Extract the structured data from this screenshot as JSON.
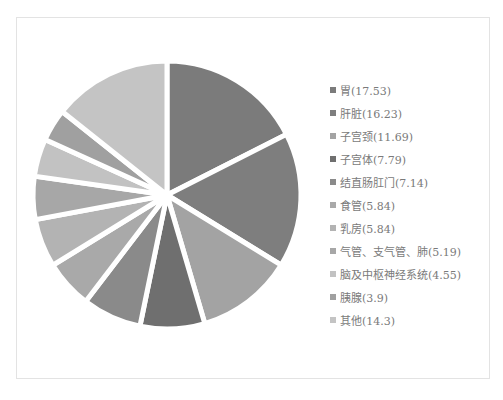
{
  "chart_data": {
    "type": "pie",
    "title": "",
    "start_angle_deg": 0,
    "direction": "clockwise",
    "legend_position": "right",
    "categories": [
      "胃",
      "肝脏",
      "子宫颈",
      "子宫体",
      "结直肠肛门",
      "食管",
      "乳房",
      "气管、支气管、肺",
      "脑及中枢神经系统",
      "胰腺",
      "其他"
    ],
    "values": [
      17.53,
      16.23,
      11.69,
      7.79,
      7.14,
      5.84,
      5.84,
      5.19,
      4.55,
      3.9,
      14.3
    ],
    "colors": [
      "#7b7b7b",
      "#7e7e7e",
      "#a3a3a3",
      "#6f6f6f",
      "#8a8a8a",
      "#a9a9a9",
      "#b3b3b3",
      "#a7a7a7",
      "#c2c2c2",
      "#a0a0a0",
      "#c4c4c4"
    ]
  },
  "legend": {
    "items": [
      {
        "label": "胃(17.53)",
        "color": "#7b7b7b"
      },
      {
        "label": "肝脏(16.23)",
        "color": "#7e7e7e"
      },
      {
        "label": "子宫颈(11.69)",
        "color": "#a3a3a3"
      },
      {
        "label": "子宫体(7.79)",
        "color": "#6f6f6f"
      },
      {
        "label": "结直肠肛门(7.14)",
        "color": "#8a8a8a"
      },
      {
        "label": "食管(5.84)",
        "color": "#a9a9a9"
      },
      {
        "label": "乳房(5.84)",
        "color": "#b3b3b3"
      },
      {
        "label": "气管、支气管、肺(5.19)",
        "color": "#a7a7a7"
      },
      {
        "label": "脑及中枢神经系统(4.55)",
        "color": "#c2c2c2"
      },
      {
        "label": "胰腺(3.9)",
        "color": "#a0a0a0"
      },
      {
        "label": "其他(14.3)",
        "color": "#c4c4c4"
      }
    ]
  }
}
